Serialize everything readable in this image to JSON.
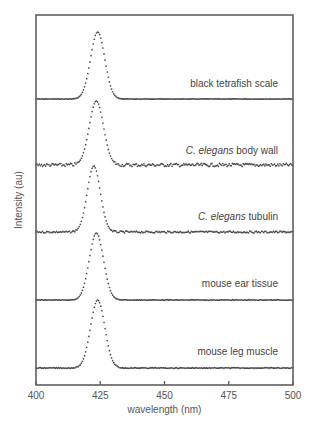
{
  "chart_data": {
    "type": "scatter",
    "title": "",
    "xlabel": "wavelength (nm)",
    "ylabel": "Intensity (au)",
    "xlim": [
      400,
      500
    ],
    "xticks": [
      400,
      425,
      450,
      475,
      500
    ],
    "yticks": [],
    "grid": false,
    "legend": "inline labels above each trace, right-aligned",
    "marker_color": "#4a4a4a",
    "frame_color": "#606060",
    "series": [
      {
        "name": "black tetrafish scale",
        "label_italic": "",
        "label_plain": "black tetrafish scale",
        "peak_nm": 424,
        "fwhm_nm": 6.5,
        "noise": 0.2
      },
      {
        "name": "C. elegans body wall",
        "label_italic": "C. elegans",
        "label_plain": " body wall",
        "peak_nm": 423.5,
        "fwhm_nm": 6.5,
        "noise": 1.6
      },
      {
        "name": "C. elegans tubulin",
        "label_italic": "C. elegans",
        "label_plain": " tubulin",
        "peak_nm": 422.5,
        "fwhm_nm": 6.0,
        "noise": 0.9
      },
      {
        "name": "mouse ear tissue",
        "label_italic": "",
        "label_plain": "mouse ear tissue",
        "peak_nm": 423.5,
        "fwhm_nm": 6.5,
        "noise": 0.3
      },
      {
        "name": "mouse leg muscle",
        "label_italic": "",
        "label_plain": "mouse leg muscle",
        "peak_nm": 424,
        "fwhm_nm": 6.5,
        "noise": 0.4
      }
    ]
  }
}
